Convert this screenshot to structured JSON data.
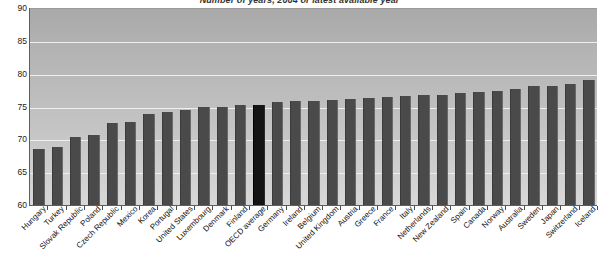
{
  "chart_data": {
    "type": "bar",
    "title": "Number of years, 2004 or latest available year",
    "xlabel": "",
    "ylabel": "",
    "ylim": [
      60,
      90
    ],
    "yticks": [
      60,
      65,
      70,
      75,
      80,
      85,
      90
    ],
    "grid": true,
    "legend": "none",
    "highlight_category": "OECD average",
    "colors": {
      "bar": "#4a4a4a",
      "highlight_bar": "#141414",
      "plot_background": "#bdbdbd",
      "gridline": "#efefef",
      "axis": "#5e5e5e"
    },
    "categories": [
      "Hungary",
      "Turkey",
      "Slovak Republic",
      "Poland",
      "Czech Republic",
      "Mexico",
      "Korea",
      "Portugal",
      "United States",
      "Luxembourg",
      "Denmark",
      "Finland",
      "OECD average",
      "Germany",
      "Ireland",
      "Belgium",
      "United Kingdom",
      "Austria",
      "Greece",
      "France",
      "Italy",
      "Netherlands",
      "New Zealand",
      "Spain",
      "Canada",
      "Norway",
      "Australia",
      "Sweden",
      "Japan",
      "Switzerland",
      "Iceland"
    ],
    "values": [
      68.6,
      68.8,
      70.3,
      70.6,
      72.5,
      72.6,
      73.9,
      74.2,
      74.5,
      74.9,
      75.0,
      75.2,
      75.3,
      75.7,
      75.8,
      75.9,
      76.0,
      76.2,
      76.3,
      76.4,
      76.6,
      76.7,
      76.8,
      77.0,
      77.2,
      77.3,
      77.6,
      78.1,
      78.2,
      78.4,
      79.0
    ]
  }
}
